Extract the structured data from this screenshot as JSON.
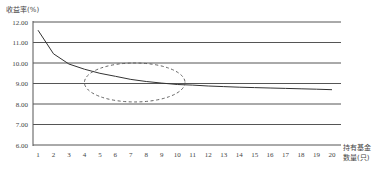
{
  "chart_data": {
    "type": "line",
    "title": "",
    "ylabel": "收益率(%)",
    "xlabel": [
      "持有基金",
      "数量(只)"
    ],
    "x": [
      1,
      2,
      3,
      4,
      5,
      6,
      7,
      8,
      9,
      10,
      11,
      12,
      13,
      14,
      15,
      16,
      17,
      18,
      19,
      20
    ],
    "series": [
      {
        "name": "收益率",
        "values": [
          11.6,
          10.45,
          9.95,
          9.7,
          9.5,
          9.35,
          9.2,
          9.1,
          9.02,
          8.95,
          8.92,
          8.88,
          8.85,
          8.82,
          8.8,
          8.78,
          8.76,
          8.74,
          8.72,
          8.7
        ]
      }
    ],
    "yticks": [
      "6.00",
      "7.00",
      "8.00",
      "9.00",
      "10.00",
      "11.00",
      "12.00"
    ],
    "ylim": [
      6,
      12
    ],
    "xlim": [
      1,
      20
    ],
    "grid": "horizontal",
    "legend": "none",
    "annotations": [
      {
        "type": "dashed-ellipse",
        "x_center": 7,
        "y_center": 9.0,
        "x_span": [
          4,
          10.5
        ],
        "y_span": [
          8.1,
          10.0
        ]
      }
    ]
  },
  "colors": {
    "line": "#333333",
    "grid": "#555555",
    "ellipse": "#555555"
  }
}
